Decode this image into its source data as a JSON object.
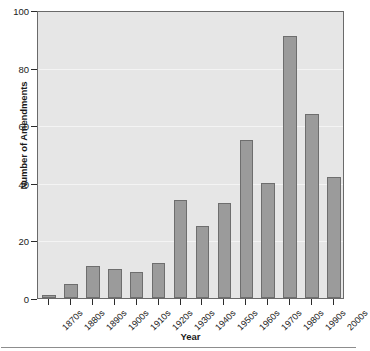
{
  "chart_data": {
    "type": "bar",
    "title": "",
    "xlabel": "Year",
    "ylabel": "Number of Amendments",
    "categories": [
      "1870s",
      "1880s",
      "1890s",
      "1900s",
      "1910s",
      "1920s",
      "1930s",
      "1940s",
      "1950s",
      "1960s",
      "1970s",
      "1980s",
      "1990s",
      "2000s"
    ],
    "values": [
      1,
      5,
      11,
      10,
      9,
      12,
      34,
      25,
      33,
      55,
      40,
      91,
      64,
      42
    ],
    "ylim": [
      0,
      100
    ],
    "yticks": [
      0,
      20,
      40,
      60,
      80,
      100
    ],
    "ytick_labels": [
      "0",
      "20",
      "40",
      "60",
      "80",
      "100"
    ],
    "grid": true,
    "legend": "none",
    "colors": {
      "bar_fill": "#9b9b9b",
      "bar_edge": "#6e6e6e",
      "plot_background": "#e6e6e6",
      "gridline": "#f4f4f4",
      "axis": "#2b2b2b",
      "text": "#1a1a1a",
      "figure_background": "#ffffff"
    }
  }
}
